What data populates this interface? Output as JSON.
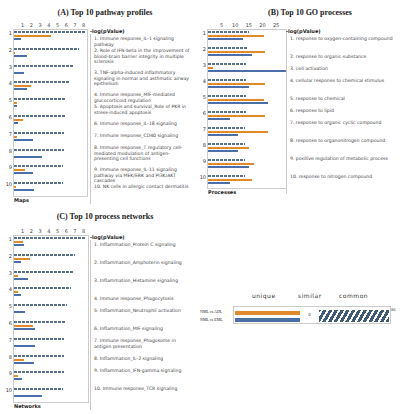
{
  "panels": {
    "A": {
      "title": "(A) Top 10 pathway profiles",
      "axis_label": "-log(pValue)",
      "ticks": [
        "1",
        "2",
        "3",
        "4",
        "5",
        "6",
        "7",
        "8"
      ],
      "corner_label": "Maps",
      "items": [
        "1. Immune response_IL-1 signaling pathway",
        "2. Role of IFN-beta in the improvement of blood-brain barrier integrity in multiple sclerosis",
        "3. TNF-alpha-induced inflammatory signaling in normal and asthmatic airway epithelium",
        "4. Immune response_MIF-mediated glucocorticoid regulation",
        "5. Apoptosis and survival_Role of PKR in stress-induced apoptosis",
        "6. Immune response_IL-18 signaling",
        "7. Immune response_CD40 signaling",
        "8. Immune response_T regulatory cell-mediated modulation of antigen-presenting cell functions",
        "9. Immune response_IL-11 signaling pathway via MEK/ERK and PI3K/AKT cascades",
        "10. NK cells in allergic contact dermatitis"
      ]
    },
    "B": {
      "title": "(B) Top 10 GO processes",
      "axis_label": "-log(pValue)",
      "ticks": [
        "5",
        "10",
        "15",
        "20",
        "25"
      ],
      "corner_label": "Processes",
      "items": [
        "1. response to oxygen-containing compound",
        "2. response to organic substance",
        "3. cell activation",
        "4. cellular response to chemical stimulus",
        "5. response to chemical",
        "6. response to lipid",
        "7. response to organic cyclic compound",
        "8. response to organonitrogen compound",
        "9. positive regulation of metabolic process",
        "10. response to nitrogen compound"
      ]
    },
    "C": {
      "title": "(C) Top 10 process networks",
      "axis_label": "-log(pValue)",
      "ticks": [
        "1",
        "2",
        "3",
        "4",
        "5",
        "6",
        "7",
        "8"
      ],
      "corner_label": "Networks",
      "items": [
        "1. Inflammation_Protein C signaling",
        "2. Inflammation_Amphoterin signaling",
        "3. Inflammation_Histamine signaling",
        "4. Immune response_Phagocytosis",
        "5. Inflammation_Neutrophil activation",
        "6. Inflammation_MIF signaling",
        "7. Immune response_Phagosome in antigen presentation",
        "8. Inflammation_IL-2 signaling",
        "9. Inflammation_IFN-gamma signaling",
        "10. Immune response_TCR signaling"
      ]
    },
    "D": {
      "headers": [
        "unique",
        "similar",
        "common"
      ],
      "rows": [
        "NML vs ADL",
        "NML vs EML"
      ],
      "similar_value": "0",
      "common_value": "80"
    }
  },
  "colors": {
    "orange": "#e08a2c",
    "blue": "#4a6fa8",
    "dashed": "#5b6f8f",
    "hatch": "#3f5a75"
  },
  "chart_data": [
    {
      "type": "bar",
      "title": "(A) Top 10 pathway profiles",
      "xlabel": "-log(pValue)",
      "ylabel": "Maps",
      "xlim": [
        0,
        8.5
      ],
      "categories": [
        "1",
        "2",
        "3",
        "4",
        "5",
        "6",
        "7",
        "8",
        "9",
        "10"
      ],
      "series": [
        {
          "name": "combined (dashed)",
          "values": [
            8.3,
            7.5,
            6.8,
            6.3,
            6.0,
            5.9,
            5.7,
            5.7,
            5.6,
            5.6
          ]
        },
        {
          "name": "orange",
          "values": [
            4.3,
            0.1,
            0,
            1.9,
            0.3,
            1.0,
            0.4,
            0,
            1.3,
            0.2
          ]
        },
        {
          "name": "blue",
          "values": [
            0.8,
            1.5,
            1.1,
            1.5,
            0.3,
            0.5,
            2.2,
            3.2,
            2.2,
            2.3
          ]
        }
      ]
    },
    {
      "type": "bar",
      "title": "(B) Top 10 GO processes",
      "xlabel": "-log(pValue)",
      "ylabel": "Processes",
      "xlim": [
        0,
        29
      ],
      "categories": [
        "1",
        "2",
        "3",
        "4",
        "5",
        "6",
        "7",
        "8",
        "9",
        "10"
      ],
      "series": [
        {
          "name": "combined (dashed)",
          "values": [
            15,
            14.5,
            14,
            14,
            14,
            14,
            13.5,
            13.5,
            13.5,
            13.5
          ]
        },
        {
          "name": "orange",
          "values": [
            20.5,
            21,
            2,
            21,
            20.5,
            21,
            22,
            15,
            17,
            16
          ]
        },
        {
          "name": "blue",
          "values": [
            13,
            16,
            29,
            15,
            22,
            8,
            11,
            11,
            15,
            8
          ]
        }
      ]
    },
    {
      "type": "bar",
      "title": "(C) Top 10 process networks",
      "xlabel": "-log(pValue)",
      "ylabel": "Networks",
      "xlim": [
        0,
        8.5
      ],
      "categories": [
        "1",
        "2",
        "3",
        "4",
        "5",
        "6",
        "7",
        "8",
        "9",
        "10"
      ],
      "series": [
        {
          "name": "combined (dashed)",
          "values": [
            8.2,
            7.0,
            6.8,
            6.6,
            6.1,
            5.9,
            5.8,
            5.8,
            5.7,
            5.6
          ]
        },
        {
          "name": "orange",
          "values": [
            1.0,
            1.8,
            0.5,
            0.5,
            0,
            2.2,
            0,
            1.2,
            0.5,
            0
          ]
        },
        {
          "name": "blue",
          "values": [
            1.2,
            0.8,
            1.6,
            0.8,
            1.3,
            2.4,
            2.4,
            2.3,
            0.9,
            3.2
          ]
        }
      ]
    },
    {
      "type": "bar",
      "title": "Overlap of unique, similar and common items",
      "categories": [
        "NML vs ADL",
        "NML vs EML"
      ],
      "series": [
        {
          "name": "unique",
          "values": [
            8,
            8
          ]
        },
        {
          "name": "similar",
          "values": [
            0,
            0
          ]
        },
        {
          "name": "common",
          "values": [
            80,
            80
          ]
        }
      ]
    }
  ]
}
